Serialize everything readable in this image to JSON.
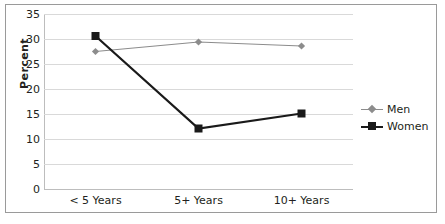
{
  "chart_data": {
    "type": "line",
    "title": "",
    "xlabel": "",
    "ylabel": "Percent",
    "categories": [
      "< 5 Years",
      "5+ Years",
      "10+ Years"
    ],
    "series": [
      {
        "name": "Men",
        "values": [
          27.5,
          29.4,
          28.6
        ],
        "color": "#8c8c8c",
        "marker": "diamond"
      },
      {
        "name": "Women",
        "values": [
          30.6,
          12.1,
          15.1
        ],
        "color": "#1a1a1a",
        "marker": "square"
      }
    ],
    "ylim": [
      0,
      35
    ],
    "ytick_step": 5,
    "yticks": [
      "35",
      "30",
      "25",
      "20",
      "15",
      "10",
      "5",
      "0"
    ],
    "grid": true,
    "legend_position": "right"
  },
  "legend": {
    "items": [
      {
        "label": "Men"
      },
      {
        "label": "Women"
      }
    ]
  },
  "colors": {
    "men": "#8c8c8c",
    "women": "#1a1a1a",
    "gridline": "#d9d9d9",
    "axis": "#bdbdbd",
    "border": "#9a9a9a",
    "text": "#231f20"
  }
}
